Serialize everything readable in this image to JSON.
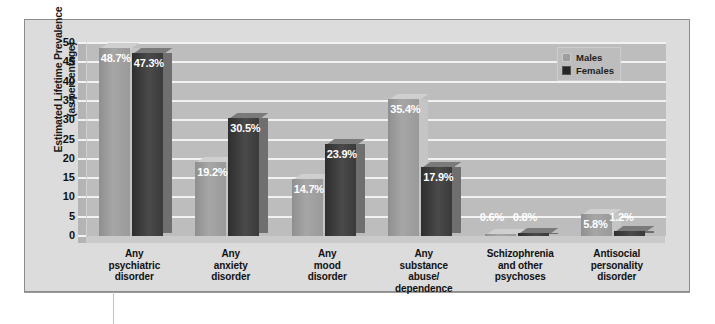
{
  "chart_data": {
    "type": "bar",
    "title": "",
    "subtitle": "",
    "xlabel": "",
    "ylabel": "Estimated Lifetime Prevalence (as percentage)",
    "ylabel_line1": "Estimated Lifetime Prevalence",
    "ylabel_line2": "(as percentage)",
    "ylim": [
      0,
      50
    ],
    "ytick_values": [
      50,
      45,
      40,
      35,
      30,
      25,
      20,
      15,
      10,
      5,
      0
    ],
    "ytick_labels": [
      "50",
      "45",
      "40",
      "35",
      "30",
      "25",
      "20",
      "15",
      "10",
      "5",
      "0"
    ],
    "grid": true,
    "grid_orientation": "horizontal",
    "legend_position": "top-right",
    "categories": [
      "Any psychiatric disorder",
      "Any anxiety disorder",
      "Any mood disorder",
      "Any substance abuse/ dependence",
      "Schizophrenia and other psychoses",
      "Antisocial personality disorder"
    ],
    "category_lines": [
      [
        "Any",
        "psychiatric",
        "disorder"
      ],
      [
        "Any",
        "anxiety",
        "disorder"
      ],
      [
        "Any",
        "mood",
        "disorder"
      ],
      [
        "Any",
        "substance",
        "abuse/",
        "dependence"
      ],
      [
        "Schizophrenia",
        "and other",
        "psychoses"
      ],
      [
        "Antisocial",
        "personality",
        "disorder"
      ]
    ],
    "series": [
      {
        "name": "Males",
        "color": "#9e9e9e",
        "values": [
          48.7,
          19.2,
          14.7,
          35.4,
          0.6,
          5.8
        ],
        "labels": [
          "48.7%",
          "19.2%",
          "14.7%",
          "35.4%",
          "0.6%",
          "5.8%"
        ]
      },
      {
        "name": "Females",
        "color": "#262626",
        "values": [
          47.3,
          30.5,
          23.9,
          17.9,
          0.8,
          1.2
        ],
        "labels": [
          "47.3%",
          "30.5%",
          "23.9%",
          "17.9%",
          "0.8%",
          "1.2%"
        ]
      }
    ]
  },
  "legend": {
    "items": [
      {
        "label": "Males"
      },
      {
        "label": "Females"
      }
    ]
  },
  "colors": {
    "page_background": "#ffffff",
    "chart_background": "#dcdcdc",
    "plot_background": "#bdbdbd",
    "gridline": "#f2f2f2",
    "males_bar": "#9e9e9e",
    "females_bar": "#262626",
    "text": "#111111",
    "value_label": "#ffffff",
    "frame_border": "#8d8d8d"
  }
}
